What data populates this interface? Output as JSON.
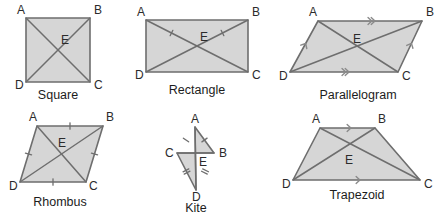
{
  "figure": {
    "background_color": "#ffffff",
    "fill_color": "#d6d6d6",
    "stroke_color": "#6e6e6e",
    "label_color": "#2b2b2b",
    "center_point_label": "E"
  },
  "shapes": [
    {
      "id": "square",
      "name": "Square",
      "name_pos": {
        "x": 58,
        "y": 99
      },
      "vertices": [
        {
          "label": "A",
          "x": 26,
          "y": 18,
          "lx": 17,
          "ly": 14
        },
        {
          "label": "B",
          "x": 90,
          "y": 18,
          "lx": 94,
          "ly": 14
        },
        {
          "label": "C",
          "x": 90,
          "y": 82,
          "lx": 94,
          "ly": 89
        },
        {
          "label": "D",
          "x": 26,
          "y": 82,
          "lx": 15,
          "ly": 89
        }
      ],
      "center": {
        "label": "E",
        "x": 58,
        "y": 50,
        "lx": 61,
        "ly": 44
      },
      "diagonals": [
        {
          "from": "A",
          "to": "C"
        },
        {
          "from": "B",
          "to": "D"
        }
      ],
      "side_marks": [],
      "diagonal_marks": []
    },
    {
      "id": "rectangle",
      "name": "Rectangle",
      "name_pos": {
        "x": 197,
        "y": 94
      },
      "vertices": [
        {
          "label": "A",
          "x": 146,
          "y": 20,
          "lx": 137,
          "ly": 16
        },
        {
          "label": "B",
          "x": 248,
          "y": 20,
          "lx": 252,
          "ly": 16
        },
        {
          "label": "C",
          "x": 248,
          "y": 72,
          "lx": 252,
          "ly": 79
        },
        {
          "label": "D",
          "x": 146,
          "y": 72,
          "lx": 135,
          "ly": 79
        }
      ],
      "center": {
        "label": "E",
        "x": 197,
        "y": 46,
        "lx": 200,
        "ly": 41
      },
      "diagonals": [
        {
          "from": "A",
          "to": "C"
        },
        {
          "from": "B",
          "to": "D"
        }
      ],
      "side_marks": [],
      "diagonal_marks": [
        {
          "on": "A-E",
          "count": 1
        },
        {
          "on": "B-E",
          "count": 1
        }
      ]
    },
    {
      "id": "parallelogram",
      "name": "Parallelogram",
      "name_pos": {
        "x": 358,
        "y": 99
      },
      "vertices": [
        {
          "label": "A",
          "x": 318,
          "y": 21,
          "lx": 309,
          "ly": 16
        },
        {
          "label": "B",
          "x": 422,
          "y": 21,
          "lx": 426,
          "ly": 16
        },
        {
          "label": "C",
          "x": 398,
          "y": 72,
          "lx": 402,
          "ly": 80
        },
        {
          "label": "D",
          "x": 290,
          "y": 72,
          "lx": 279,
          "ly": 80
        }
      ],
      "center": {
        "label": "E",
        "x": 357,
        "y": 46,
        "lx": 353,
        "ly": 43
      },
      "diagonals": [
        {
          "from": "A",
          "to": "C"
        },
        {
          "from": "B",
          "to": "D"
        }
      ],
      "side_marks": [
        {
          "on": "A-B",
          "type": "chevron",
          "count": 2
        },
        {
          "on": "D-C",
          "type": "chevron",
          "count": 2
        },
        {
          "on": "D-A",
          "type": "chevron",
          "count": 1
        },
        {
          "on": "C-B",
          "type": "chevron",
          "count": 1
        }
      ],
      "diagonal_marks": []
    },
    {
      "id": "rhombus",
      "name": "Rhombus",
      "name_pos": {
        "x": 60,
        "y": 206
      },
      "vertices": [
        {
          "label": "A",
          "x": 37,
          "y": 126,
          "lx": 29,
          "ly": 121
        },
        {
          "label": "B",
          "x": 103,
          "y": 126,
          "lx": 106,
          "ly": 121
        },
        {
          "label": "C",
          "x": 86,
          "y": 182,
          "lx": 89,
          "ly": 190
        },
        {
          "label": "D",
          "x": 20,
          "y": 182,
          "lx": 9,
          "ly": 190
        }
      ],
      "center": {
        "label": "E",
        "x": 61,
        "y": 154,
        "lx": 58,
        "ly": 147
      },
      "diagonals": [
        {
          "from": "A",
          "to": "C"
        },
        {
          "from": "B",
          "to": "D"
        }
      ],
      "side_marks": [
        {
          "on": "A-B",
          "type": "tick",
          "count": 1
        },
        {
          "on": "B-C",
          "type": "tick",
          "count": 1
        },
        {
          "on": "C-D",
          "type": "tick",
          "count": 1
        },
        {
          "on": "D-A",
          "type": "tick",
          "count": 1
        }
      ],
      "diagonal_marks": []
    },
    {
      "id": "kite",
      "name": "Kite",
      "name_pos": {
        "x": 196,
        "y": 212
      },
      "vertices": [
        {
          "label": "A",
          "x": 195,
          "y": 127,
          "lx": 191,
          "ly": 123
        },
        {
          "label": "B",
          "x": 214,
          "y": 153,
          "lx": 219,
          "ly": 157
        },
        {
          "label": "C",
          "x": 177,
          "y": 153,
          "lx": 165,
          "ly": 157
        },
        {
          "label": "D",
          "x": 196,
          "y": 190,
          "lx": 192,
          "ly": 201
        }
      ],
      "center": {
        "label": "E",
        "x": 196,
        "y": 160,
        "lx": 199,
        "ly": 166
      },
      "diagonals": [
        {
          "from": "A",
          "to": "D"
        },
        {
          "from": "C",
          "to": "B"
        }
      ],
      "side_marks": [
        {
          "on": "C-A",
          "type": "tick",
          "count": 1
        },
        {
          "on": "A-B",
          "type": "tick",
          "count": 1
        },
        {
          "on": "C-D",
          "type": "tick",
          "count": 2
        },
        {
          "on": "B-D",
          "type": "tick",
          "count": 2
        }
      ],
      "diagonal_marks": []
    },
    {
      "id": "trapezoid",
      "name": "Trapezoid",
      "name_pos": {
        "x": 357,
        "y": 199
      },
      "vertices": [
        {
          "label": "A",
          "x": 320,
          "y": 128,
          "lx": 312,
          "ly": 123
        },
        {
          "label": "B",
          "x": 375,
          "y": 128,
          "lx": 378,
          "ly": 123
        },
        {
          "label": "C",
          "x": 420,
          "y": 180,
          "lx": 424,
          "ly": 188
        },
        {
          "label": "D",
          "x": 293,
          "y": 180,
          "lx": 282,
          "ly": 188
        }
      ],
      "center": {
        "label": "E",
        "x": 352,
        "y": 157,
        "lx": 345,
        "ly": 164
      },
      "diagonals": [
        {
          "from": "A",
          "to": "C"
        },
        {
          "from": "B",
          "to": "D"
        }
      ],
      "side_marks": [
        {
          "on": "A-B",
          "type": "chevron",
          "count": 1
        },
        {
          "on": "D-C",
          "type": "chevron",
          "count": 1
        }
      ],
      "diagonal_marks": []
    }
  ]
}
